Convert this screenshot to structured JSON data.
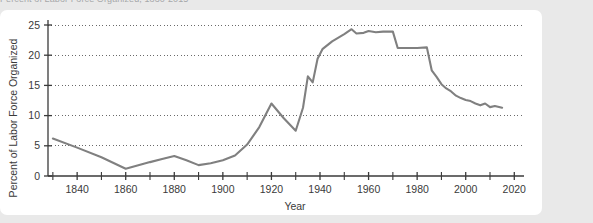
{
  "top_cut_text": "Percent of Labor Force Organized, 1830-2015",
  "chart_data": {
    "type": "line",
    "title": "",
    "xlabel": "Year",
    "ylabel": "Percent of Labor Force Organized",
    "xlim": [
      1828,
      2024
    ],
    "ylim": [
      0,
      26
    ],
    "grid": true,
    "grid_axis": "y",
    "grid_style": "dotted",
    "legend": "none",
    "line_color": "#808080",
    "axis_color": "#3a3a3a",
    "xticks_major": [
      1840,
      1860,
      1880,
      1900,
      1920,
      1940,
      1960,
      1980,
      2000,
      2020
    ],
    "xticks_minor": [
      1830,
      1850,
      1870,
      1890,
      1910,
      1930,
      1950,
      1970,
      1990,
      2010
    ],
    "xtick_labels": [
      "1840",
      "1860",
      "1880",
      "1900",
      "1920",
      "1940",
      "1960",
      "1980",
      "2000",
      "2020"
    ],
    "yticks": [
      0,
      5,
      10,
      15,
      20,
      25
    ],
    "ytick_labels": [
      "0",
      "5",
      "10",
      "15",
      "20",
      "25"
    ],
    "series": [
      {
        "name": "Percent of Labor Force Organized",
        "color": "#808080",
        "x": [
          1830,
          1840,
          1850,
          1860,
          1870,
          1875,
          1880,
          1885,
          1890,
          1895,
          1900,
          1905,
          1910,
          1915,
          1920,
          1925,
          1930,
          1933,
          1935,
          1937,
          1939,
          1941,
          1945,
          1950,
          1953,
          1955,
          1958,
          1960,
          1963,
          1966,
          1970,
          1972,
          1975,
          1980,
          1984,
          1986,
          1988,
          1990,
          1992,
          1994,
          1996,
          1998,
          2000,
          2002,
          2004,
          2006,
          2008,
          2010,
          2012,
          2015
        ],
        "y": [
          6.2,
          4.7,
          3.1,
          1.2,
          2.3,
          2.8,
          3.3,
          2.6,
          1.8,
          2.1,
          2.6,
          3.4,
          5.2,
          8.1,
          12.0,
          9.6,
          7.5,
          11.3,
          16.5,
          15.5,
          19.4,
          21.0,
          22.3,
          23.5,
          24.3,
          23.6,
          23.7,
          24.0,
          23.8,
          23.9,
          23.9,
          21.2,
          21.2,
          21.2,
          21.3,
          17.5,
          16.4,
          15.2,
          14.5,
          14.0,
          13.3,
          12.9,
          12.6,
          12.4,
          12.0,
          11.7,
          12.0,
          11.4,
          11.6,
          11.3
        ]
      }
    ]
  }
}
